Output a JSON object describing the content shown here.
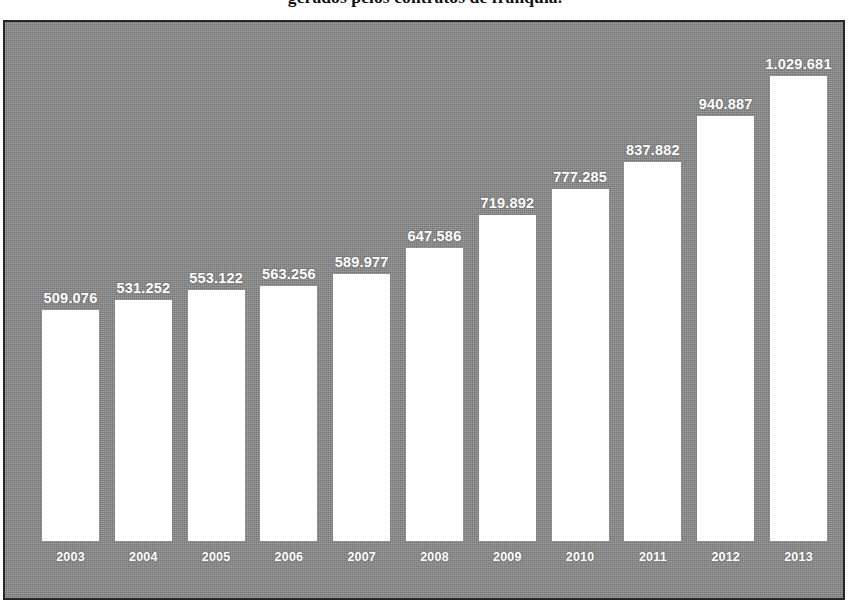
{
  "title": "gerados pelos contratos de franquia.",
  "colors": {
    "plot_background": "#8b8b8b",
    "bar_fill": "#ffffff",
    "label_text": "#ffffff",
    "border": "#262626",
    "title_text": "#111111"
  },
  "chart_data": {
    "type": "bar",
    "title": "gerados pelos contratos de franquia.",
    "xlabel": "",
    "ylabel": "",
    "grid": false,
    "legend": "none",
    "ylim": [
      0,
      1100000
    ],
    "categories": [
      "2003",
      "2004",
      "2005",
      "2006",
      "2007",
      "2008",
      "2009",
      "2010",
      "2011",
      "2012",
      "2013"
    ],
    "values": [
      509076,
      531252,
      553122,
      563256,
      589977,
      647586,
      719892,
      777285,
      837882,
      940887,
      1029681
    ],
    "value_labels": [
      "509.076",
      "531.252",
      "553.122",
      "563.256",
      "589.977",
      "647.586",
      "719.892",
      "777.285",
      "837.882",
      "940.887",
      "1.029.681"
    ]
  }
}
